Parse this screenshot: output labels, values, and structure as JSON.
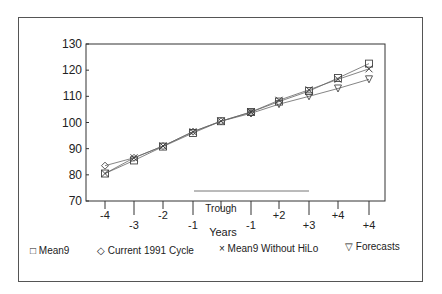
{
  "chart_data": {
    "type": "line",
    "title": "",
    "xlabel": "Years",
    "ylabel": "",
    "ylim": [
      70,
      130
    ],
    "yticks": [
      70,
      80,
      90,
      100,
      110,
      120,
      130
    ],
    "categories": [
      "-4",
      "-3",
      "-2",
      "-1",
      "Trough",
      "-1",
      "+2",
      "+3",
      "+4",
      "+4"
    ],
    "grid": false,
    "legend_position": "bottom",
    "series": [
      {
        "name": "Mean9",
        "marker": "square",
        "values": [
          80.5,
          85.5,
          90.8,
          96,
          100.5,
          104,
          108,
          112,
          117,
          122.5
        ]
      },
      {
        "name": "Current 1991 Cycle",
        "marker": "diamond",
        "values": [
          83.5,
          86.5,
          91,
          96.5,
          100.5,
          103.5,
          null,
          null,
          null,
          null
        ]
      },
      {
        "name": "Mean9 Without HiLo",
        "marker": "x",
        "values": [
          80.5,
          86.5,
          91,
          96.5,
          100.5,
          104,
          108.5,
          112.5,
          116.5,
          120.5
        ]
      },
      {
        "name": "Forecasts",
        "marker": "triangle-down",
        "values": [
          null,
          null,
          null,
          null,
          null,
          103.5,
          107,
          110,
          113,
          116.5
        ]
      }
    ],
    "annotations": [
      "horizontal bar segment between -1 and +3 near bottom of plot"
    ]
  },
  "axis": {
    "y_labels": [
      "130",
      "120",
      "110",
      "100",
      "90",
      "80",
      "70"
    ],
    "x_labels": [
      "-4",
      "-3",
      "-2",
      "-1",
      "Trough",
      "-1",
      "+2",
      "+3",
      "+4",
      "+4"
    ],
    "x_title": "Years"
  },
  "legend": {
    "items": [
      {
        "symbol": "□",
        "label": "Mean9"
      },
      {
        "symbol": "◇",
        "label": "Current 1991 Cycle"
      },
      {
        "symbol": "×",
        "label": "Mean9 Without HiLo"
      },
      {
        "symbol": "▽",
        "label": "Forecasts"
      }
    ]
  }
}
